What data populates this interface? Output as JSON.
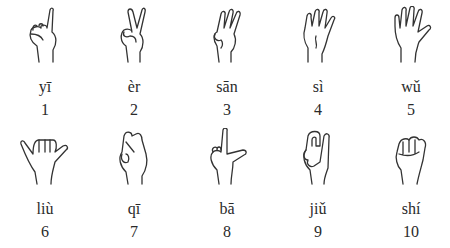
{
  "rows": [
    {
      "items": [
        {
          "pinyin": "yī",
          "number": "1",
          "gesture": "index-finger-up"
        },
        {
          "pinyin": "èr",
          "number": "2",
          "gesture": "two-fingers-v"
        },
        {
          "pinyin": "sān",
          "number": "3",
          "gesture": "three-fingers-up"
        },
        {
          "pinyin": "sì",
          "number": "4",
          "gesture": "four-fingers-up"
        },
        {
          "pinyin": "wǔ",
          "number": "5",
          "gesture": "open-palm-five"
        }
      ]
    },
    {
      "items": [
        {
          "pinyin": "liù",
          "number": "6",
          "gesture": "thumb-and-pinky-out"
        },
        {
          "pinyin": "qī",
          "number": "7",
          "gesture": "fingertips-pinched"
        },
        {
          "pinyin": "bā",
          "number": "8",
          "gesture": "thumb-and-index-l"
        },
        {
          "pinyin": "jiǔ",
          "number": "9",
          "gesture": "hooked-index"
        },
        {
          "pinyin": "shí",
          "number": "10",
          "gesture": "closed-fist"
        }
      ]
    }
  ]
}
